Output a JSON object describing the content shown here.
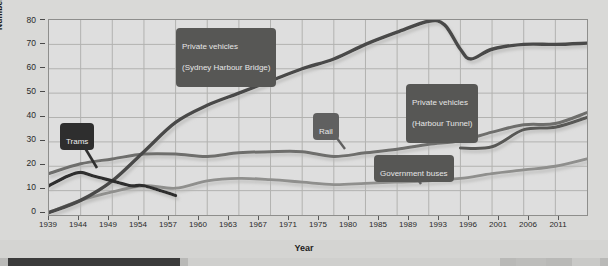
{
  "chart_data": {
    "type": "line",
    "title": "",
    "xlabel": "Year",
    "ylabel": "Number of passengers and drivers (million)",
    "xlim": [
      1939,
      2011
    ],
    "ylim": [
      0,
      80
    ],
    "yticks": [
      0,
      10,
      20,
      30,
      40,
      50,
      60,
      70,
      80
    ],
    "xticks": [
      1939,
      1944,
      1949,
      1954,
      1957,
      1960,
      1963,
      1967,
      1971,
      1975,
      1980,
      1985,
      1989,
      1993,
      1996,
      2001,
      2006,
      2011
    ],
    "grid": true,
    "legend": "annotated-callouts",
    "series": [
      {
        "name": "Private vehicles (Sydney Harbour Bridge)",
        "color": "#4a4a48",
        "x": [
          1939,
          1944,
          1949,
          1954,
          1957,
          1960,
          1963,
          1967,
          1971,
          1975,
          1980,
          1985,
          1989,
          1991,
          1993,
          1994,
          1996,
          2001,
          2006,
          2011
        ],
        "values": [
          1,
          6,
          14,
          26,
          38,
          45,
          50,
          55,
          60,
          64,
          70,
          75,
          79.5,
          78,
          68,
          64,
          68,
          70,
          70,
          70.5
        ]
      },
      {
        "name": "Rail",
        "color": "#6e6e6c",
        "x": [
          1939,
          1944,
          1949,
          1954,
          1957,
          1960,
          1963,
          1967,
          1971,
          1975,
          1980,
          1985,
          1989,
          1993,
          1996,
          2001,
          2006,
          2011
        ],
        "values": [
          17,
          21,
          23,
          25,
          25,
          24,
          25.5,
          26,
          26,
          24,
          25.5,
          27,
          29,
          30.5,
          34,
          37,
          37.5,
          42
        ]
      },
      {
        "name": "Trams",
        "color": "#2f2f2f",
        "x": [
          1939,
          1942,
          1944,
          1946,
          1949,
          1952,
          1954,
          1957
        ],
        "values": [
          12,
          16,
          17.5,
          16,
          14,
          12,
          12,
          8
        ]
      },
      {
        "name": "Government buses",
        "color": "#8f8f8d",
        "x": [
          1939,
          1944,
          1949,
          1954,
          1957,
          1960,
          1963,
          1967,
          1971,
          1975,
          1980,
          1985,
          1989,
          1993,
          1996,
          2001,
          2006,
          2011
        ],
        "values": [
          1,
          6,
          9.5,
          12,
          11,
          14,
          15,
          14.5,
          13.5,
          12.5,
          13,
          13.5,
          14,
          15,
          17,
          18.5,
          20,
          23
        ]
      },
      {
        "name": "Private vehicles (Harbour Tunnel)",
        "color": "#585856",
        "x": [
          1993,
          1996,
          2001,
          2006,
          2011
        ],
        "values": [
          27.5,
          28,
          35,
          36,
          40
        ]
      }
    ],
    "annotations": [
      {
        "label": "Trams",
        "style": "dark"
      },
      {
        "label": "Private vehicles\n(Sydney Harbour Bridge)",
        "style": "mid"
      },
      {
        "label": "Rail",
        "style": "mid2"
      },
      {
        "label": "Private vehicles\n(Harbour Tunnel)",
        "style": "mid"
      },
      {
        "label": "Government buses",
        "style": "mid"
      }
    ]
  },
  "axis": {
    "y_title": "Number of passengers and drivers (million)",
    "x_title": "Year",
    "y_labels": [
      "80",
      "70",
      "60",
      "50",
      "40",
      "30",
      "20",
      "10",
      "0"
    ],
    "x_labels": [
      "1939",
      "1944",
      "1949",
      "1954",
      "1957",
      "1960",
      "1963",
      "1967",
      "1971",
      "1975",
      "1980",
      "1985",
      "1989",
      "1993",
      "1996",
      "2001",
      "2006",
      "2011"
    ]
  },
  "callouts": {
    "trams": "Trams",
    "bridge_line1": "Private vehicles",
    "bridge_line2": "(Sydney Harbour Bridge)",
    "rail": "Rail",
    "tunnel_line1": "Private vehicles",
    "tunnel_line2": "(Harbour Tunnel)",
    "buses": "Government buses"
  },
  "colors": {
    "plot_bg": "#dedede",
    "page_bg": "#d9d9d7",
    "grid": "#b0b0ae",
    "frame": "#8e8e8c",
    "bridge": "#4a4a48",
    "rail": "#6e6e6c",
    "trams": "#2f2f2f",
    "buses": "#8f8f8d",
    "tunnel": "#585856"
  }
}
